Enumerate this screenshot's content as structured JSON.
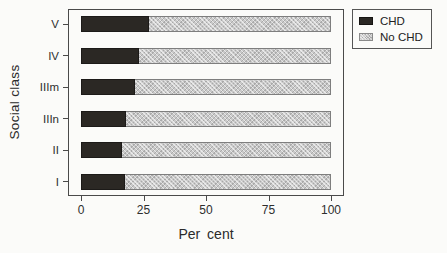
{
  "chart_data": {
    "type": "bar",
    "orientation": "horizontal",
    "stacked": true,
    "title": "",
    "xlabel": "Per cent",
    "ylabel": "Social class",
    "categories": [
      "V",
      "IV",
      "IIIm",
      "IIIn",
      "II",
      "I"
    ],
    "series": [
      {
        "name": "CHD",
        "color": "#2b2824",
        "pattern": "solid",
        "values": [
          27,
          23,
          21.5,
          18,
          16.5,
          17.5
        ]
      },
      {
        "name": "No CHD",
        "color": "#c9c9c9",
        "pattern": "stipple",
        "values": [
          73,
          77,
          78.5,
          82,
          83.5,
          82.5
        ]
      }
    ],
    "xlim": [
      0,
      100
    ],
    "xticks": [
      0,
      25,
      50,
      75,
      100
    ],
    "grid": false,
    "legend_position": "top-right-outside"
  },
  "layout_colors": {
    "background": "#fbfbf9",
    "axis": "#4a4a4a",
    "text": "#2a2a2a"
  }
}
